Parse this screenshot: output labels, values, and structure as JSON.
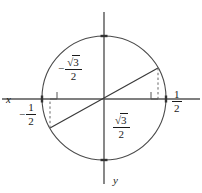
{
  "figure": {
    "type": "unit-circle-diagram",
    "width": 202,
    "height": 193,
    "background": "#ffffff",
    "stroke_color": "#4a4a4a",
    "text_color": "#1a1a1a"
  },
  "axes": {
    "x_label": "x",
    "y_label": "y",
    "x_axis": {
      "x1": 2,
      "y1": 99,
      "x2": 200,
      "y2": 99
    },
    "y_axis": {
      "x1": 104,
      "y1": 12,
      "x2": 104,
      "y2": 184
    },
    "y_direction_note": "y increases downward"
  },
  "circle": {
    "center_x": 104,
    "center_y": 98,
    "radius": 62
  },
  "line": {
    "description": "diameter through origin",
    "point_upper_right": {
      "x": 158,
      "y": 68
    },
    "point_lower_left": {
      "x": 50,
      "y": 128
    }
  },
  "dashed_segments": [
    {
      "name": "right-drop",
      "x1": 158,
      "y1": 68,
      "x2": 158,
      "y2": 99
    },
    {
      "name": "left-drop",
      "x1": 50,
      "y1": 128,
      "x2": 50,
      "y2": 99
    }
  ],
  "right_angle_marks": [
    {
      "name": "right-angle-right",
      "x": 158,
      "y": 99,
      "dir_x": -1,
      "dir_y": -1
    },
    {
      "name": "right-angle-left",
      "x": 50,
      "y": 99,
      "dir_x": 1,
      "dir_y": -1
    }
  ],
  "axis_ticks": [
    {
      "name": "tick-right",
      "x": 166,
      "y": 99
    },
    {
      "name": "tick-left",
      "x": 42,
      "y": 99
    },
    {
      "name": "tick-top",
      "x": 104,
      "y": 36
    },
    {
      "name": "tick-bottom",
      "x": 104,
      "y": 160
    }
  ],
  "labels": {
    "upper_left": {
      "name": "label-neg-sqrt3-over-2",
      "sign": "−",
      "numerator_prefix": "√",
      "numerator_radicand": "3",
      "denominator": "2",
      "reads_as": "−√3/2"
    },
    "lower_right": {
      "name": "label-sqrt3-over-2",
      "sign": "",
      "numerator_prefix": "√",
      "numerator_radicand": "3",
      "denominator": "2",
      "reads_as": "√3/2"
    },
    "right": {
      "name": "label-one-half",
      "sign": "",
      "numerator": "1",
      "denominator": "2",
      "reads_as": "1/2"
    },
    "left": {
      "name": "label-neg-one-half",
      "sign": "−",
      "numerator": "1",
      "denominator": "2",
      "reads_as": "−1/2"
    }
  }
}
